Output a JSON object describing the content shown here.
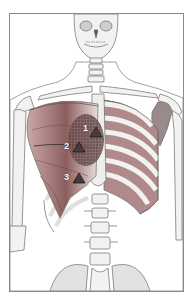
{
  "figure": {
    "frame_color": "#8a8a8a",
    "colors": {
      "bone_fill": "#f2f2f0",
      "bone_outline": "#6b6b6b",
      "muscle_fill": "#9a6a6a",
      "muscle_dark": "#6e4848",
      "referred_pain_stipple": "#5a4a4a",
      "marker_fill": "#4a3a3a",
      "intercostal_fill": "#b08a8a"
    }
  },
  "markers": [
    {
      "label": "1",
      "shape": "triangle"
    },
    {
      "label": "2",
      "shape": "triangle"
    },
    {
      "label": "3",
      "shape": "triangle"
    }
  ]
}
